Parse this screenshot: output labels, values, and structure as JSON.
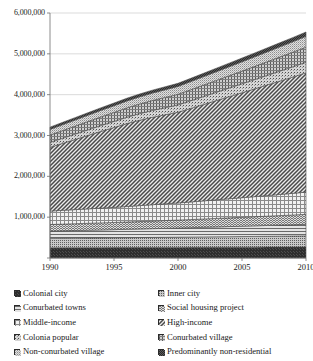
{
  "chart_data": {
    "type": "area",
    "stacked": true,
    "title": "",
    "xlabel": "",
    "ylabel": "",
    "x": [
      1990,
      1991,
      1992,
      1993,
      1994,
      1995,
      1996,
      1997,
      1998,
      1999,
      2000,
      2001,
      2002,
      2003,
      2004,
      2005,
      2006,
      2007,
      2008,
      2009,
      2010
    ],
    "xtick_labels": [
      "1990",
      "1995",
      "2000",
      "2005",
      "2010"
    ],
    "xticks": [
      1990,
      1995,
      2000,
      2005,
      2010
    ],
    "xlim": [
      1990,
      2010
    ],
    "ylim": [
      0,
      6000000
    ],
    "yticks": [
      0,
      1000000,
      2000000,
      3000000,
      4000000,
      5000000,
      6000000
    ],
    "ytick_labels": [
      "",
      "1,000,000",
      "2,000,000",
      "3,000,000",
      "4,000,000",
      "5,000,000",
      "6,000,000"
    ],
    "grid": true,
    "legend_position": "bottom",
    "series": [
      {
        "name": "Colonial city",
        "pattern": "solid-dark",
        "color": "#3b3b3b",
        "values": [
          250000,
          251000,
          252000,
          253000,
          254000,
          255000,
          256000,
          257000,
          258000,
          259000,
          260000,
          261000,
          262000,
          263000,
          264000,
          265000,
          266000,
          267000,
          268000,
          269000,
          270000
        ]
      },
      {
        "name": "Inner city",
        "pattern": "fine-dots",
        "color": "#8f8f8f",
        "values": [
          230000,
          232000,
          234000,
          236000,
          238000,
          240000,
          242000,
          244000,
          246000,
          248000,
          250000,
          252000,
          254000,
          256000,
          258000,
          260000,
          262000,
          264000,
          266000,
          268000,
          270000
        ]
      },
      {
        "name": "Conurbated towns",
        "pattern": "horizontal-lines",
        "color": "#a0a0a0",
        "values": [
          180000,
          184000,
          188000,
          192000,
          196000,
          200000,
          205000,
          210000,
          215000,
          220000,
          225000,
          230000,
          236000,
          242000,
          248000,
          254000,
          260000,
          266000,
          272000,
          278000,
          285000
        ]
      },
      {
        "name": "Social housing project",
        "pattern": "dense-weave",
        "color": "#bdbdbd",
        "values": [
          160000,
          163000,
          166000,
          169000,
          172000,
          175000,
          178000,
          182000,
          186000,
          190000,
          194000,
          198000,
          203000,
          208000,
          213000,
          218000,
          223000,
          228000,
          233000,
          238000,
          244000
        ]
      },
      {
        "name": "Middle-income",
        "pattern": "grid",
        "color": "#d8d8d8",
        "values": [
          330000,
          338000,
          346000,
          354000,
          362000,
          370000,
          380000,
          390000,
          400000,
          410000,
          420000,
          432000,
          444000,
          456000,
          468000,
          480000,
          492000,
          505000,
          518000,
          531000,
          545000
        ]
      },
      {
        "name": "High-income",
        "pattern": "diagonal-hatch",
        "color": "#9a9a9a",
        "values": [
          1560000,
          1640000,
          1720000,
          1800000,
          1880000,
          1955000,
          2030000,
          2090000,
          2140000,
          2180000,
          2220000,
          2290000,
          2360000,
          2430000,
          2500000,
          2570000,
          2640000,
          2710000,
          2780000,
          2850000,
          2920000
        ]
      },
      {
        "name": "Colonia popular",
        "pattern": "sparse-dots",
        "color": "#8a8a8a",
        "values": [
          120000,
          126000,
          132000,
          138000,
          144000,
          150000,
          156000,
          162000,
          168000,
          174000,
          180000,
          188000,
          196000,
          204000,
          212000,
          220000,
          228000,
          236000,
          244000,
          252000,
          260000
        ]
      },
      {
        "name": "Conurbated village",
        "pattern": "cross-weave",
        "color": "#707070",
        "values": [
          180000,
          188000,
          196000,
          204000,
          212000,
          220000,
          228000,
          236000,
          244000,
          252000,
          260000,
          270000,
          280000,
          290000,
          300000,
          310000,
          322000,
          334000,
          346000,
          358000,
          370000
        ]
      },
      {
        "name": "Non-conurbated village",
        "pattern": "medium-dots",
        "color": "#b5b5b5",
        "values": [
          140000,
          145000,
          150000,
          155000,
          160000,
          165000,
          170000,
          176000,
          182000,
          188000,
          194000,
          201000,
          208000,
          215000,
          222000,
          229000,
          236000,
          243000,
          250000,
          257000,
          265000
        ]
      },
      {
        "name": "Predominantly non-residential",
        "pattern": "dark-checker",
        "color": "#555555",
        "values": [
          55000,
          57000,
          59000,
          61000,
          63000,
          65000,
          67000,
          69000,
          71000,
          73000,
          75000,
          78000,
          81000,
          84000,
          87000,
          90000,
          93000,
          96000,
          99000,
          102000,
          105000
        ]
      }
    ],
    "totals": [
      3205000,
      3324000,
      3443000,
      3562000,
      3681000,
      3795000,
      3912000,
      4026000,
      4130000,
      4222000,
      4308000,
      4420000,
      4534000,
      4648000,
      4762000,
      4876000,
      4992000,
      5109000,
      5226000,
      5343000,
      5464000
    ]
  },
  "axes": {
    "ytick_labels": [
      "6,000,000",
      "5,000,000",
      "4,000,000",
      "3,000,000",
      "2,000,000",
      "1,000,000"
    ],
    "xtick_labels": [
      "1990",
      "1995",
      "2000",
      "2005",
      "2010"
    ]
  },
  "legend": {
    "left_column": [
      {
        "label": "Colonial city",
        "swatch": "solid-dark"
      },
      {
        "label": "Conurbated towns",
        "swatch": "horizontal-lines"
      },
      {
        "label": "Middle-income",
        "swatch": "grid"
      },
      {
        "label": "Colonia popular",
        "swatch": "sparse-dots"
      },
      {
        "label": "Non-conurbated village",
        "swatch": "medium-dots"
      }
    ],
    "right_column": [
      {
        "label": "Inner city",
        "swatch": "fine-dots"
      },
      {
        "label": "Social housing project",
        "swatch": "dense-weave"
      },
      {
        "label": "High-income",
        "swatch": "diagonal-hatch"
      },
      {
        "label": "Conurbated village",
        "swatch": "cross-weave"
      },
      {
        "label": "Predominantly non-residential",
        "swatch": "dark-checker"
      }
    ]
  },
  "colors": {
    "axis": "#6e6e6e",
    "grid": "#cccccc",
    "text": "#1a1a1a",
    "background": "#ffffff"
  }
}
